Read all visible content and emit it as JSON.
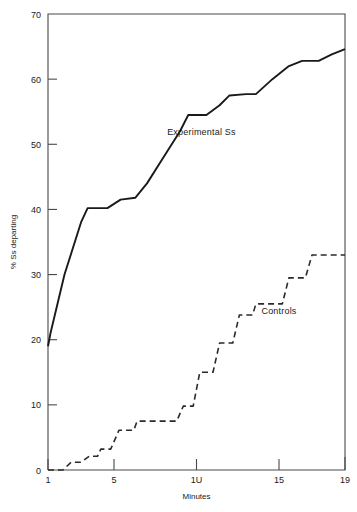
{
  "chart_data": {
    "type": "line",
    "title": "",
    "xlabel": "Minutes",
    "ylabel": "% Ss departing",
    "xlim": [
      1,
      19
    ],
    "ylim": [
      0,
      70
    ],
    "grid": false,
    "legend_position": "inline-annotation",
    "xticks": [
      {
        "value": 1,
        "label": "1"
      },
      {
        "value": 5,
        "label": "5"
      },
      {
        "value": 10,
        "label": "1U"
      },
      {
        "value": 15,
        "label": "15"
      },
      {
        "value": 19,
        "label": "19"
      }
    ],
    "yticks": [
      {
        "value": 0,
        "label": "0"
      },
      {
        "value": 10,
        "label": "10"
      },
      {
        "value": 20,
        "label": "20"
      },
      {
        "value": 30,
        "label": "30"
      },
      {
        "value": 40,
        "label": "40"
      },
      {
        "value": 50,
        "label": "50"
      },
      {
        "value": 60,
        "label": "60"
      },
      {
        "value": 70,
        "label": "70"
      }
    ],
    "series": [
      {
        "name": "Experimental Ss",
        "style": "solid",
        "color": "#1a1a1a",
        "annotation": "Experimental Ss",
        "x": [
          1,
          1.15,
          2,
          3,
          3.4,
          4.6,
          5.4,
          6.3,
          7,
          8,
          9,
          9.5,
          10.6,
          11.4,
          12,
          13,
          13.6,
          14.6,
          15.6,
          16.4,
          17.4,
          18.2,
          19
        ],
        "y": [
          19,
          21,
          30,
          38,
          40.2,
          40.2,
          41.5,
          41.8,
          44,
          48,
          52,
          54.5,
          54.5,
          56,
          57.5,
          57.7,
          57.7,
          60,
          62,
          62.8,
          62.8,
          63.8,
          64.6
        ]
      },
      {
        "name": "Controls",
        "style": "dashed",
        "color": "#2a2a2a",
        "annotation": "Controls",
        "x": [
          1,
          1.9,
          2.4,
          3,
          3.5,
          4,
          4.2,
          4.8,
          5.3,
          6.2,
          6.4,
          8.8,
          9.2,
          9.8,
          10.2,
          11,
          11.4,
          12.2,
          12.6,
          13.4,
          13.6,
          15.2,
          15.6,
          16.6,
          17,
          19
        ],
        "y": [
          0,
          0,
          1.2,
          1.2,
          2.1,
          2.1,
          3.2,
          3.2,
          6.1,
          6.1,
          7.5,
          7.5,
          9.8,
          9.8,
          15,
          15,
          19.5,
          19.5,
          23.8,
          23.8,
          25.5,
          25.5,
          29.5,
          29.5,
          33,
          33
        ]
      }
    ],
    "annotations": [
      {
        "text": "Experimental Ss",
        "x": 10.3,
        "y": 51.5
      },
      {
        "text": "Controls",
        "x": 15.0,
        "y": 24.0
      }
    ]
  }
}
